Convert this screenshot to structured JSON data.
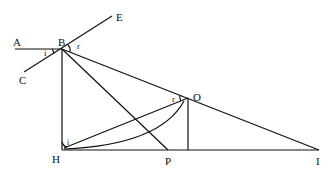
{
  "diagram": {
    "type": "geometric-optics-refraction",
    "points": {
      "A": {
        "label": "A",
        "x": 15,
        "y": 49
      },
      "B": {
        "label": "B",
        "x": 62,
        "y": 49
      },
      "C": {
        "label": "C",
        "x": 24,
        "y": 72
      },
      "E": {
        "label": "E",
        "x": 112,
        "y": 16
      },
      "O": {
        "label": "O",
        "x": 188,
        "y": 98
      },
      "H": {
        "label": "H",
        "x": 62,
        "y": 150
      },
      "P": {
        "label": "P",
        "x": 168,
        "y": 150
      },
      "I": {
        "label": "I",
        "x": 319,
        "y": 150
      }
    },
    "angle_labels": {
      "i_at_B": "i",
      "r_at_B": "r",
      "r_at_O": "r",
      "i_at_H": "i"
    },
    "segments": [
      "A-B",
      "C-E",
      "B-H",
      "B-P",
      "B-I",
      "H-I",
      "H-O",
      "O-foot",
      "arc H-O"
    ],
    "stroke_color": "#111111"
  }
}
